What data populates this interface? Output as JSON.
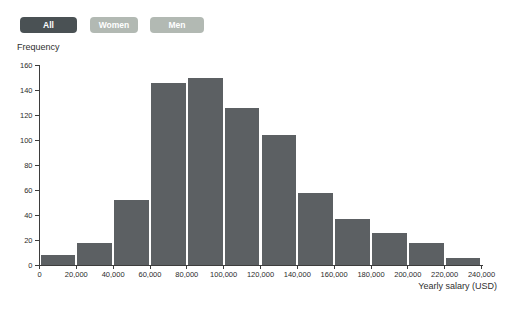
{
  "filter_buttons": [
    {
      "label": "All",
      "active": true
    },
    {
      "label": "Women",
      "active": false
    },
    {
      "label": "Men",
      "active": false
    }
  ],
  "chart_data": {
    "type": "bar",
    "subtype": "histogram",
    "title": "",
    "xlabel": "Yearly salary (USD)",
    "ylabel": "Frequency",
    "bin_width": 20000,
    "bin_edges": [
      0,
      20000,
      40000,
      60000,
      80000,
      100000,
      120000,
      140000,
      160000,
      180000,
      200000,
      220000,
      240000
    ],
    "categories": [
      "0-20,000",
      "20,000-40,000",
      "40,000-60,000",
      "60,000-80,000",
      "80,000-100,000",
      "100,000-120,000",
      "120,000-140,000",
      "140,000-160,000",
      "160,000-180,000",
      "180,000-200,000",
      "200,000-220,000",
      "220,000-240,000"
    ],
    "values": [
      8,
      18,
      52,
      146,
      150,
      126,
      104,
      58,
      37,
      26,
      18,
      6
    ],
    "x_tick_labels": [
      "0",
      "20,000",
      "40,000",
      "60,000",
      "80,000",
      "100,000",
      "120,000",
      "140,000",
      "160,000",
      "180,000",
      "200,000",
      "220,000",
      "240,000"
    ],
    "y_ticks": [
      0,
      20,
      40,
      60,
      80,
      100,
      120,
      140,
      160
    ],
    "ylim": [
      0,
      160
    ],
    "xlim": [
      0,
      240000
    ],
    "grid": false,
    "legend_position": "none"
  },
  "colors": {
    "bar": "#5c6063",
    "button_active_bg": "#4a5154",
    "button_inactive_bg": "#b2b9b3",
    "button_text": "#ffffff",
    "axis": "#3d3d3d",
    "label_text": "#2b2b2b",
    "background": "#ffffff"
  }
}
